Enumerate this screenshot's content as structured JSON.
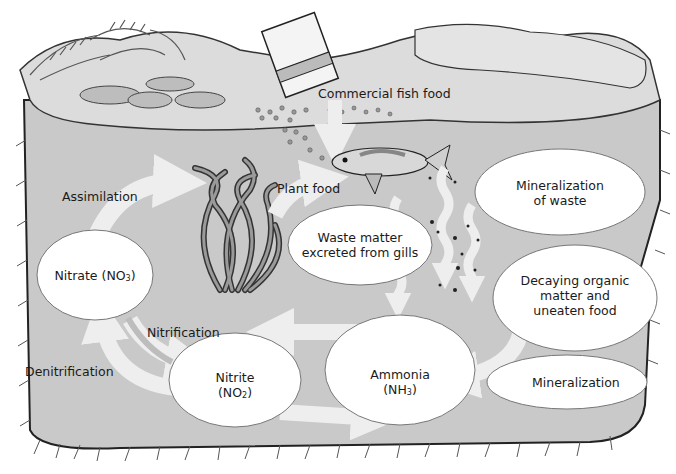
{
  "diagram": {
    "colors": {
      "water": "#c9c9c9",
      "bank": "#dcdcdc",
      "bubble": "#ffffff",
      "arrow": "#eeeeee",
      "outline": "#222222",
      "text": "#1a1a1a"
    },
    "nodes": {
      "fish_food": {
        "label": "Commercial fish food"
      },
      "plant_food": {
        "label": "Plant food"
      },
      "assimilation": {
        "label": "Assimilation"
      },
      "nitrate": {
        "label": "Nitrate (NO",
        "sub": "3",
        "close": ")"
      },
      "waste_gills": {
        "line1": "Waste matter",
        "line2": "excreted from gills"
      },
      "mineralization_waste": {
        "line1": "Mineralization",
        "line2": "of waste"
      },
      "decaying": {
        "line1": "Decaying organic",
        "line2": "matter and",
        "line3": "uneaten food"
      },
      "nitrification": {
        "label": "Nitrification"
      },
      "denitrification": {
        "label": "Denitrification"
      },
      "nitrite": {
        "line1": "Nitrite",
        "open": "(NO",
        "sub": "2",
        "close": ")"
      },
      "ammonia": {
        "line1": "Ammonia",
        "open": "(NH",
        "sub": "3",
        "close": ")"
      },
      "mineralization": {
        "label": "Mineralization"
      }
    },
    "illustrations": [
      "fish-food-can",
      "food-pellets",
      "fish",
      "aquatic-plant",
      "ferns",
      "rocks",
      "lily-pads",
      "waste-particles"
    ]
  }
}
